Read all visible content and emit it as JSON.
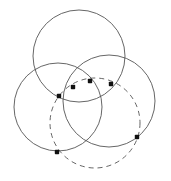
{
  "figure": {
    "title": "",
    "type": "geometric-diagram",
    "canvas": {
      "width": 171,
      "height": 181,
      "background": "#ffffff"
    },
    "styles": {
      "solid_stroke_color": "#555555",
      "solid_stroke_width": 0.9,
      "dashed_stroke_color": "#555555",
      "dashed_stroke_width": 0.9,
      "dash_pattern": "5,4",
      "point_color": "#111111",
      "point_size": 4.4
    },
    "circles": [
      {
        "name": "top-circle",
        "cx": 79,
        "cy": 56,
        "r": 46,
        "style": "solid"
      },
      {
        "name": "left-circle",
        "cx": 58,
        "cy": 107,
        "r": 44,
        "style": "solid"
      },
      {
        "name": "right-circle",
        "cx": 109,
        "cy": 101,
        "r": 46,
        "style": "solid"
      },
      {
        "name": "dashed-circle",
        "cx": 95,
        "cy": 123,
        "r": 45,
        "style": "dashed"
      }
    ],
    "points": [
      {
        "name": "point-1",
        "x": 59,
        "y": 96,
        "label": ""
      },
      {
        "name": "point-2",
        "x": 73,
        "y": 87,
        "label": ""
      },
      {
        "name": "point-3",
        "x": 90,
        "y": 81,
        "label": ""
      },
      {
        "name": "point-4",
        "x": 111,
        "y": 84,
        "label": ""
      },
      {
        "name": "point-5",
        "x": 137,
        "y": 137,
        "label": ""
      },
      {
        "name": "point-6",
        "x": 57,
        "y": 152,
        "label": ""
      }
    ]
  }
}
